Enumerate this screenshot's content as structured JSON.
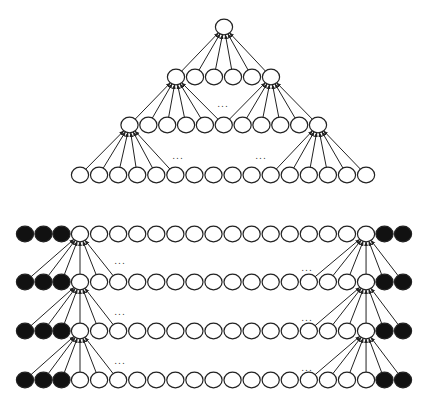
{
  "figure": {
    "colors": {
      "stroke": "#222222",
      "white_fill": "#ffffff",
      "pad_fill": "#111111"
    },
    "node_radius_x": 8.6,
    "node_radius_y": 7.8,
    "ellipsis": "..."
  },
  "tree": {
    "levels": [
      {
        "y": 27,
        "x0": 224,
        "dx": 19.0,
        "count": 1
      },
      {
        "y": 77,
        "x0": 176,
        "dx": 19.0,
        "count": 6
      },
      {
        "y": 125,
        "x0": 129.5,
        "dx": 18.85,
        "count": 11
      },
      {
        "y": 175,
        "x0": 80,
        "dx": 19.07,
        "count": 16
      }
    ],
    "fans": [
      {
        "parent_level": 0,
        "parent_index": 0,
        "child_level": 1,
        "children": [
          0,
          1,
          2,
          3,
          4,
          5
        ]
      },
      {
        "parent_level": 1,
        "parent_index": 0,
        "child_level": 2,
        "children": [
          0,
          1,
          2,
          3,
          4,
          5
        ]
      },
      {
        "parent_level": 1,
        "parent_index": 5,
        "child_level": 2,
        "children": [
          5,
          6,
          7,
          8,
          9,
          10
        ]
      },
      {
        "parent_level": 2,
        "parent_index": 0,
        "child_level": 3,
        "children": [
          0,
          1,
          2,
          3,
          4,
          5
        ]
      },
      {
        "parent_level": 2,
        "parent_index": 10,
        "child_level": 3,
        "children": [
          10,
          11,
          12,
          13,
          14,
          15
        ]
      }
    ],
    "ellipses": [
      {
        "x": 223,
        "y": 107
      },
      {
        "x": 178,
        "y": 159
      },
      {
        "x": 261,
        "y": 159
      }
    ]
  },
  "layers": {
    "rows_y": [
      234,
      282,
      331,
      380
    ],
    "white_x0": 80,
    "white_dx": 19.07,
    "white_count": 16,
    "left_pad_x": [
      25,
      43.5,
      61.5
    ],
    "right_pad_x": [
      384.5,
      403
    ],
    "fan_offsets": [
      -3,
      -2,
      -1,
      0,
      1,
      2
    ],
    "left_target_index": 0,
    "right_target_index": 15,
    "ellipses": [
      {
        "x": 120,
        "y": 264
      },
      {
        "x": 307,
        "y": 271
      },
      {
        "x": 120,
        "y": 315
      },
      {
        "x": 307,
        "y": 321
      },
      {
        "x": 120,
        "y": 364
      },
      {
        "x": 307,
        "y": 371
      }
    ]
  }
}
